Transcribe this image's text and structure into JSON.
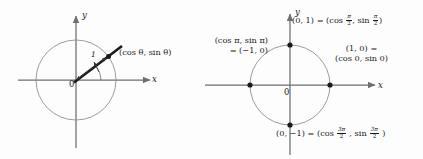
{
  "figure": {
    "background_color": "#fdfdfd",
    "ink_color": "#1a1a1a",
    "circle_stroke": "#7b7b7b",
    "axis_stroke": "#6e6e6e",
    "width": 423,
    "height": 159
  },
  "left_panel": {
    "name": "unit-circle-general-angle",
    "axis_y_label": "y",
    "axis_x_label": "x",
    "origin_label": "0",
    "radius_label": "1",
    "point_label": "(cos θ, sin θ)",
    "angle_symbol": "θ",
    "circle": {
      "cx": 76,
      "cy": 80,
      "r": 40
    },
    "terminal_point": {
      "x": 108.5,
      "y": 56.5
    },
    "angle_degrees": 36
  },
  "right_panel": {
    "name": "unit-circle-quadrantal-angles",
    "axis_y_label": "y",
    "axis_x_label": "x",
    "origin_label": "0",
    "circle": {
      "cx": 290,
      "cy": 85,
      "r": 40
    },
    "labels": {
      "top": {
        "coordinate": "(0, 1)",
        "equals": "=",
        "cos_prefix": "(cos",
        "cos_angle_num": "π",
        "cos_angle_den": "2",
        "comma": ",",
        "sin_prefix": "sin",
        "sin_angle_num": "π",
        "sin_angle_den": "2",
        "close": ")"
      },
      "left": {
        "line1": "(cos π, sin π)",
        "line2": "= (−1, 0)"
      },
      "right": {
        "line1": "(1, 0) =",
        "line2": "(cos 0, sin 0)"
      },
      "bottom": {
        "coordinate": "(0, −1)",
        "equals": "=",
        "cos_prefix": "(cos",
        "cos_angle_num": "3π",
        "cos_angle_den": "2",
        "comma": ",",
        "sin_prefix": "sin",
        "sin_angle_num": "3π",
        "sin_angle_den": "2",
        "close": ")"
      }
    },
    "points": [
      {
        "name": "point-top",
        "coord": "(0, 1)",
        "x": 290,
        "y": 45
      },
      {
        "name": "point-left",
        "coord": "(-1, 0)",
        "x": 250,
        "y": 85
      },
      {
        "name": "point-right",
        "coord": "(1, 0)",
        "x": 330,
        "y": 85
      },
      {
        "name": "point-bottom",
        "coord": "(0, -1)",
        "x": 290,
        "y": 125
      }
    ]
  }
}
